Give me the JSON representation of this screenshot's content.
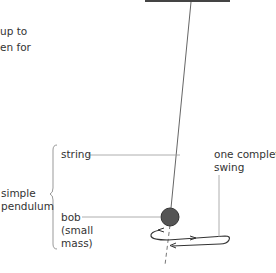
{
  "intro_text": {
    "line1": "up to",
    "line2": "en for"
  },
  "labels": {
    "string": "string",
    "simple_pendulum_line1": "simple",
    "simple_pendulum_line2": "pendulum",
    "bob_line1": "bob",
    "bob_line2": "(small",
    "bob_line3": "mass)",
    "swing_line1": "one complete",
    "swing_line2": "swing"
  },
  "colors": {
    "bob": "#555555",
    "string": "#666666",
    "leader": "#999999",
    "text": "#333333"
  }
}
